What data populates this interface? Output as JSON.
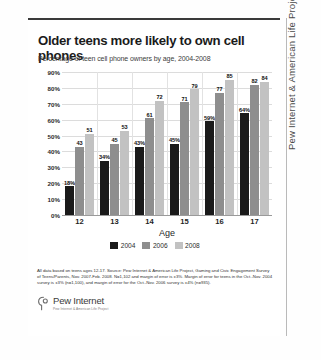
{
  "title": "Older teens more likely to own cell phones",
  "subtitle": "Percentage of teen cell phone owners by age, 2004-2008",
  "side_label": "Pew Internet & American Life Project",
  "footnote": "All data based on teens ages 12-17.  Source: Pew Internet & American Life Project, Gaming and Civic Engagement Survey of Teens/Parents, Nov. 2007-Feb. 2008.  N=1,102 and margin of error is ±3%. Margin of error for teens in the Oct.-Nov. 2004 survey is ±3% (n=1,100), and margin of error for the Oct.-Nov. 2006 survey is ±4% (n=935).",
  "logo": {
    "name": "Pew Internet",
    "tagline": "Pew Internet & American Life Project"
  },
  "chart_data": {
    "type": "bar",
    "title": "Older teens more likely to own cell phones",
    "subtitle": "Percentage of teen cell phone owners by age, 2004-2008",
    "xlabel": "Age",
    "ylabel": "",
    "ylim": [
      0,
      90
    ],
    "grid": true,
    "legend_position": "bottom",
    "categories": [
      "12",
      "13",
      "14",
      "15",
      "16",
      "17"
    ],
    "ytick_labels": [
      "90%",
      "80%",
      "70%",
      "60%",
      "50%",
      "40%",
      "30%",
      "20%",
      "10%",
      "0%"
    ],
    "ytick_values": [
      90,
      80,
      70,
      60,
      50,
      40,
      30,
      20,
      10,
      0
    ],
    "series": [
      {
        "name": "2004",
        "color": "#1a1a1a",
        "values": [
          18,
          34,
          43,
          45,
          59,
          64
        ],
        "labels": [
          "18%",
          "34%",
          "43%",
          "45%",
          "59%",
          "64%"
        ]
      },
      {
        "name": "2006",
        "color": "#8e8e8e",
        "values": [
          43,
          45,
          61,
          71,
          77,
          82
        ],
        "labels": [
          "43",
          "45",
          "61",
          "71",
          "77",
          "82"
        ]
      },
      {
        "name": "2008",
        "color": "#c2c2c2",
        "values": [
          51,
          53,
          72,
          79,
          85,
          84
        ],
        "labels": [
          "51",
          "53",
          "72",
          "79",
          "85",
          "84"
        ]
      }
    ]
  }
}
